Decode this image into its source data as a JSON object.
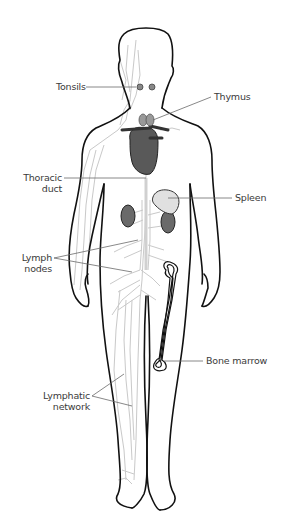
{
  "diagram": {
    "colors": {
      "outline": "#111111",
      "lymph_vessels": "#c8c8c8",
      "organ_dark": "#555555",
      "organ_light": "#d9d9d9",
      "leader_line": "#6a6a6a",
      "label_text": "#3a3a3a",
      "background": "#ffffff"
    },
    "labels": {
      "tonsils": "Tonsils",
      "thymus": "Thymus",
      "thoracic_duct_line1": "Thoracic",
      "thoracic_duct_line2": "duct",
      "spleen": "Spleen",
      "lymph_nodes_line1": "Lymph",
      "lymph_nodes_line2": "nodes",
      "bone_marrow": "Bone marrow",
      "lymphatic_network_line1": "Lymphatic",
      "lymphatic_network_line2": "network"
    }
  }
}
